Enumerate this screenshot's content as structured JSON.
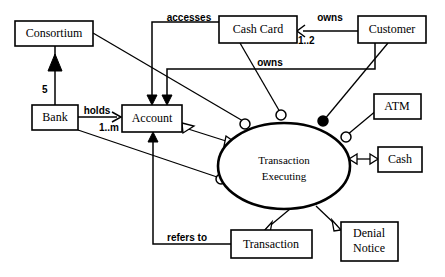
{
  "diagram": {
    "background_color": "#ffffff",
    "line_color": "#000000",
    "nodes": [
      {
        "id": "consortium",
        "label": "Consortium",
        "shape": "rect"
      },
      {
        "id": "bank",
        "label": "Bank",
        "shape": "rect"
      },
      {
        "id": "account",
        "label": "Account",
        "shape": "rect"
      },
      {
        "id": "cash_card",
        "label": "Cash Card",
        "shape": "rect"
      },
      {
        "id": "customer",
        "label": "Customer",
        "shape": "rect"
      },
      {
        "id": "atm",
        "label": "ATM",
        "shape": "rect"
      },
      {
        "id": "cash",
        "label": "Cash",
        "shape": "rect"
      },
      {
        "id": "transaction",
        "label": "Transaction",
        "shape": "rect"
      },
      {
        "id": "denial_notice",
        "label_line1": "Denial",
        "label_line2": "Notice",
        "shape": "rect"
      },
      {
        "id": "transaction_executing",
        "label_line1": "Transaction",
        "label_line2": "Executing",
        "shape": "ellipse"
      }
    ],
    "edge_labels": {
      "accesses": "accesses",
      "owns_customer_cashcard": "owns",
      "owns_customer_account": "owns",
      "holds": "holds",
      "refers_to": "refers to"
    },
    "multiplicities": {
      "consortium_bank": "5",
      "cash_card_count": "1..2",
      "account_count": "1..m"
    }
  }
}
